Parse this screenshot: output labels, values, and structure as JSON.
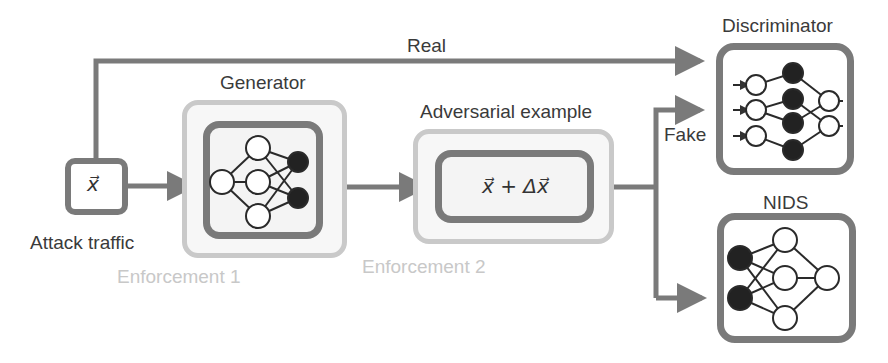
{
  "diagram": {
    "colors": {
      "arrow": "#7a7a7a",
      "enforcement_border": "#c9c9c9",
      "enforcement_text": "#c8c8c8",
      "node_filled": "#222222",
      "node_empty": "#ffffff",
      "text": "#3a3a3a"
    },
    "nodes": {
      "input": {
        "label": "Attack traffic",
        "symbol": "x⃗"
      },
      "generator": {
        "label": "Generator",
        "enforcement": "Enforcement 1"
      },
      "adversarial": {
        "label": "Adversarial example",
        "formula_x": "x⃗",
        "formula_plus": "+",
        "formula_delta": "Δx⃗",
        "enforcement": "Enforcement 2"
      },
      "discriminator": {
        "label": "Discriminator"
      },
      "nids": {
        "label": "NIDS"
      }
    },
    "edges": [
      {
        "from": "input",
        "to": "discriminator",
        "label": "Real"
      },
      {
        "from": "input",
        "to": "generator",
        "label": ""
      },
      {
        "from": "generator",
        "to": "adversarial",
        "label": ""
      },
      {
        "from": "adversarial",
        "to": "discriminator",
        "label": "Fake"
      },
      {
        "from": "adversarial",
        "to": "nids",
        "label": ""
      }
    ]
  }
}
